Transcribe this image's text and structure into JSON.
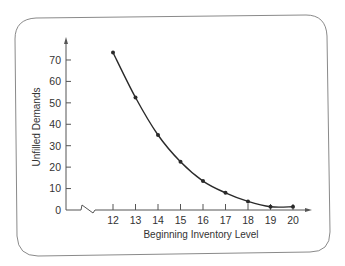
{
  "chart_data": {
    "type": "line",
    "title": "",
    "xlabel": "Beginning Inventory Level",
    "ylabel": "Unfilled Demands",
    "x": [
      12,
      13,
      14,
      15,
      16,
      17,
      18,
      19,
      20
    ],
    "series": [
      {
        "name": "Unfilled Demands",
        "values": [
          73.5,
          52.5,
          35,
          22.5,
          13.5,
          8,
          4,
          1.5,
          1.5
        ]
      }
    ],
    "x_ticks": [
      "12",
      "13",
      "14",
      "15",
      "16",
      "17",
      "18",
      "19",
      "20"
    ],
    "y_ticks": [
      "0",
      "10",
      "20",
      "30",
      "40",
      "50",
      "60",
      "70"
    ],
    "ylim": [
      0,
      75
    ],
    "xlim": [
      11,
      20.8
    ],
    "x_axis_break": true,
    "grid": false,
    "legend": "none",
    "markers": true,
    "smooth_curve": true
  },
  "colors": {
    "line": "#2a2a2a",
    "axis": "#555555",
    "frame": "#8a8a8a",
    "text": "#333333"
  }
}
